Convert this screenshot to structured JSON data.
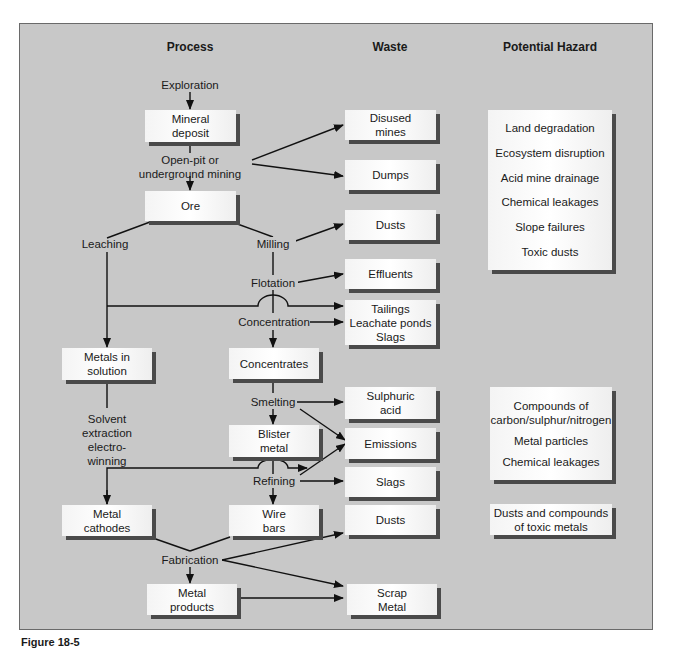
{
  "headers": {
    "process": "Process",
    "waste": "Waste",
    "hazard": "Potential Hazard"
  },
  "process": {
    "exploration": "Exploration",
    "mineral_deposit": [
      "Mineral",
      "deposit"
    ],
    "mining": [
      "Open-pit or",
      "underground mining"
    ],
    "ore": "Ore",
    "leaching": "Leaching",
    "milling": "Milling",
    "flotation": "Flotation",
    "concentration": "Concentration",
    "metals_in_solution": [
      "Metals in",
      "solution"
    ],
    "concentrates": "Concentrates",
    "solvent_extraction": [
      "Solvent",
      "extraction",
      "electro-",
      "winning"
    ],
    "smelting": "Smelting",
    "blister_metal": [
      "Blister",
      "metal"
    ],
    "refining": "Refining",
    "metal_cathodes": [
      "Metal",
      "cathodes"
    ],
    "wire_bars": [
      "Wire",
      "bars"
    ],
    "fabrication": "Fabrication",
    "metal_products": [
      "Metal",
      "products"
    ]
  },
  "waste": {
    "disused_mines": [
      "Disused",
      "mines"
    ],
    "dumps": "Dumps",
    "dusts_1": "Dusts",
    "effluents": "Effluents",
    "tailings": [
      "Tailings",
      "Leachate ponds",
      "Slags"
    ],
    "sulphuric_acid": [
      "Sulphuric",
      "acid"
    ],
    "emissions": "Emissions",
    "slags": "Slags",
    "dusts_2": "Dusts",
    "scrap_metal": [
      "Scrap",
      "Metal"
    ]
  },
  "hazards": {
    "group_1": [
      "Land degradation",
      "Ecosystem disruption",
      "Acid mine drainage",
      "Chemical leakages",
      "Slope failures",
      "Toxic dusts"
    ],
    "group_2": [
      "Compounds of",
      "carbon/sulphur/nitrogen",
      "Metal particles",
      "Chemical leakages"
    ],
    "group_3": [
      "Dusts and compounds",
      "of toxic metals"
    ]
  },
  "caption": "Figure 18-5",
  "colors": {
    "panel": "#c8c8c8",
    "box_fill": "#f6f6f6",
    "box_shadow": "#4a4a4a",
    "line": "#111111"
  }
}
